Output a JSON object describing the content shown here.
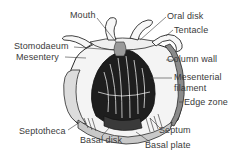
{
  "diagram": {
    "labels": {
      "mouth": "Mouth",
      "oral_disk": "Oral disk",
      "tentacle": "Tentacle",
      "stomodaeum": "Stomodaeum",
      "mesentery": "Mesentery",
      "column_wall": "Column wall",
      "mesenterial_1": "Mesenterial",
      "mesenterial_2": "filament",
      "edge_zone": "Edge zone",
      "septotheca": "Septotheca",
      "septum": "Septum",
      "basal_disk": "Basal disk",
      "basal_plate": "Basal plate"
    },
    "colors": {
      "ink": "#2a2a2a",
      "label_text": "#3a3a3a",
      "background": "#ffffff"
    }
  }
}
